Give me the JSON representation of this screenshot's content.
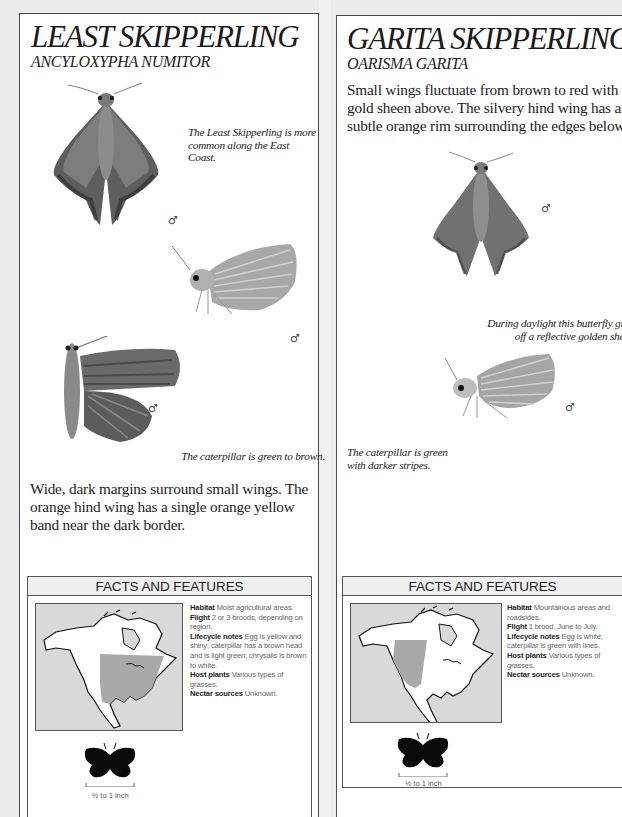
{
  "pages": [
    {
      "title": "LEAST SKIPPERLING",
      "scientific_name": "ANCYLOXYPHA NUMITOR",
      "captions": {
        "upperside": "The Least Skipperling is more common along the East Coast.",
        "caterpillar": "The caterpillar is green to brown."
      },
      "sex_symbol": "♂",
      "description": "Wide, dark margins surround small wings. The orange hind wing has a single orange  yellow band near the dark border.",
      "facts": {
        "header": "FACTS AND FEATURES",
        "entries": [
          {
            "label": "Habitat",
            "text": "Moist agricultural areas."
          },
          {
            "label": "Flight",
            "text": "2 or 3 broods, depending on region."
          },
          {
            "label": "Lifecycle notes",
            "text": "Egg is yellow and shiny; caterpillar has a brown head and is light green; chrysalis is brown to white."
          },
          {
            "label": "Host plants",
            "text": "Various types of grasses."
          },
          {
            "label": "Nectar sources",
            "text": "Unknown."
          }
        ],
        "size_label": "½ to 1 inch",
        "range_region": "eastern-north-america"
      }
    },
    {
      "title": "GARITA SKIPPERLING",
      "scientific_name": "OARISMA GARITA",
      "description": "Small wings fluctuate from brown to red with a gold sheen above. The silvery hind wing has a subtle orange rim surrounding the edges below.",
      "captions": {
        "daylight": "During daylight this butterfly gives off a reflective golden sheen.",
        "caterpillar": "The caterpillar is green with darker stripes."
      },
      "sex_symbol": "♂",
      "facts": {
        "header": "FACTS AND FEATURES",
        "entries": [
          {
            "label": "Habitat",
            "text": "Mountainous areas and roadsides."
          },
          {
            "label": "Flight",
            "text": "1 brood, June to July."
          },
          {
            "label": "Lifecycle notes",
            "text": "Egg is white; caterpillar is green with lines."
          },
          {
            "label": "Host plants",
            "text": "Various types of grasses."
          },
          {
            "label": "Nectar sources",
            "text": "Unknown."
          }
        ],
        "size_label": "½ to 1 inch",
        "range_region": "western-north-america"
      }
    }
  ],
  "colors": {
    "range_shade": "#a9a9a9",
    "map_water": "#d9d9d9",
    "land": "#ffffff",
    "border": "#4a4a4a"
  }
}
